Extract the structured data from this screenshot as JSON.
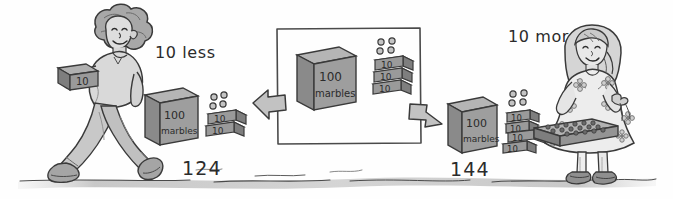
{
  "illustration": {
    "title": "10 less and 10 more with base-ten blocks",
    "style": "hand-drawn pencil sketch, grayscale",
    "background_color": "#fefefe",
    "ink_color": "#2b2b2b",
    "block_fill": "#9a9a9a",
    "block_top_fill": "#b5b5b5",
    "block_side_fill": "#7e7e7e",
    "ground_color": "#c9c9c9"
  },
  "labels": {
    "ten_less": "10 less",
    "ten_more": "10 more",
    "left_total": "124",
    "right_total": "144"
  },
  "left_group": {
    "character": "boy-walking-left",
    "carried_block_label": "10",
    "hundred_cube": {
      "top_label": "100",
      "bottom_label": "marbles"
    },
    "ten_rods": [
      "10",
      "10"
    ],
    "ones_dots": 4,
    "total": "124"
  },
  "center_group": {
    "framed": true,
    "hundred_cube": {
      "top_label": "100",
      "bottom_label": "marbles"
    },
    "ten_rods": [
      "10",
      "10",
      "10"
    ],
    "ones_dots": 4,
    "total": "134"
  },
  "right_group": {
    "character": "girl-holding-tray",
    "hundred_cube": {
      "top_label": "100",
      "bottom_label": "marbles"
    },
    "ten_rods": [
      "10",
      "10",
      "10",
      "10"
    ],
    "ones_dots": 4,
    "total": "144"
  },
  "arrows": {
    "left_arrow": "arrow-pointing-left",
    "right_arrow": "arrow-pointing-right"
  }
}
